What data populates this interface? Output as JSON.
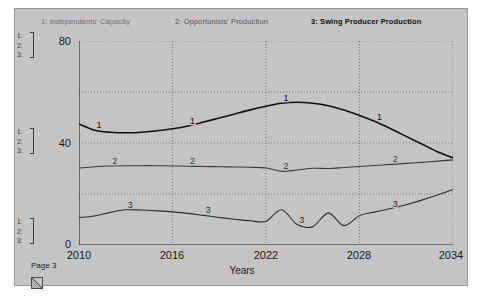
{
  "window": {
    "page_label": "Page 3",
    "page_turn_icon": "page-turn-corner-icon",
    "background_color": "#c4c4c4"
  },
  "legend": {
    "items": [
      {
        "key": "1",
        "label": "1: Independents' Capacity",
        "color": "#6e6e6e",
        "bold": false
      },
      {
        "key": "2",
        "label": "2: Opportunists' Production",
        "color": "#555555",
        "bold": false
      },
      {
        "key": "3",
        "label": "3: Swing Producer Production",
        "color": "#111111",
        "bold": true
      }
    ]
  },
  "scale_markers": [
    {
      "position": "top",
      "lines": [
        "1:",
        "2:",
        "3:"
      ]
    },
    {
      "position": "middle",
      "lines": [
        "1:",
        "2:",
        "3:"
      ]
    },
    {
      "position": "bottom",
      "lines": [
        "1:",
        "2:",
        "3:"
      ]
    }
  ],
  "chart_data": {
    "type": "line",
    "title": "",
    "xlabel": "Years",
    "ylabel": "",
    "xlim": [
      2010,
      2034
    ],
    "ylim": [
      0,
      80
    ],
    "xticks": [
      2010,
      2016,
      2022,
      2028,
      2034
    ],
    "yticks": [
      0,
      40,
      80
    ],
    "y_minor_ticks": [
      20,
      60
    ],
    "grid": true,
    "grid_style": "dotted",
    "legend_position": "top",
    "x": [
      2010,
      2011,
      2012,
      2013,
      2014,
      2015,
      2016,
      2017,
      2018,
      2019,
      2020,
      2021,
      2022,
      2023,
      2024,
      2025,
      2026,
      2027,
      2028,
      2029,
      2030,
      2031,
      2032,
      2033,
      2034
    ],
    "series": [
      {
        "name": "Independents' Capacity",
        "key": "1",
        "color": "#111111",
        "width": 1.6,
        "marker_label": "1",
        "marker_x": [
          2011,
          2017,
          2023,
          2029
        ],
        "values": [
          47.5,
          45.0,
          44.2,
          44.0,
          44.2,
          44.8,
          45.6,
          46.7,
          48.2,
          49.8,
          51.4,
          53.0,
          54.4,
          55.6,
          56.0,
          55.6,
          54.6,
          52.9,
          50.8,
          48.4,
          45.6,
          42.6,
          39.6,
          36.6,
          34.2
        ]
      },
      {
        "name": "Opportunists' Production",
        "key": "2",
        "color": "#3a3a3a",
        "width": 1.1,
        "marker_label": "2",
        "marker_x": [
          2012,
          2017,
          2023,
          2030
        ],
        "values": [
          30.2,
          30.7,
          31.0,
          31.1,
          31.1,
          31.1,
          31.0,
          30.9,
          30.8,
          30.7,
          30.6,
          30.5,
          30.2,
          28.9,
          29.4,
          30.1,
          30.0,
          30.4,
          30.8,
          31.2,
          31.6,
          32.0,
          32.4,
          32.9,
          33.4
        ]
      },
      {
        "name": "Swing Producer Production",
        "key": "3",
        "color": "#2b2b2b",
        "width": 1.1,
        "marker_label": "3",
        "marker_x": [
          2013,
          2018,
          2024,
          2030
        ],
        "values": [
          10.8,
          11.4,
          12.8,
          13.8,
          13.7,
          13.4,
          13.0,
          12.4,
          11.6,
          10.8,
          10.1,
          9.5,
          9.3,
          13.8,
          8.0,
          7.2,
          12.5,
          7.6,
          11.5,
          13.0,
          14.3,
          15.8,
          17.6,
          19.6,
          21.8
        ]
      }
    ]
  },
  "axes": {
    "x_title": "Years",
    "x_tick_labels": [
      "2010",
      "2016",
      "2022",
      "2028",
      "2034"
    ],
    "y_tick_labels": [
      "80",
      "40",
      "0"
    ]
  }
}
